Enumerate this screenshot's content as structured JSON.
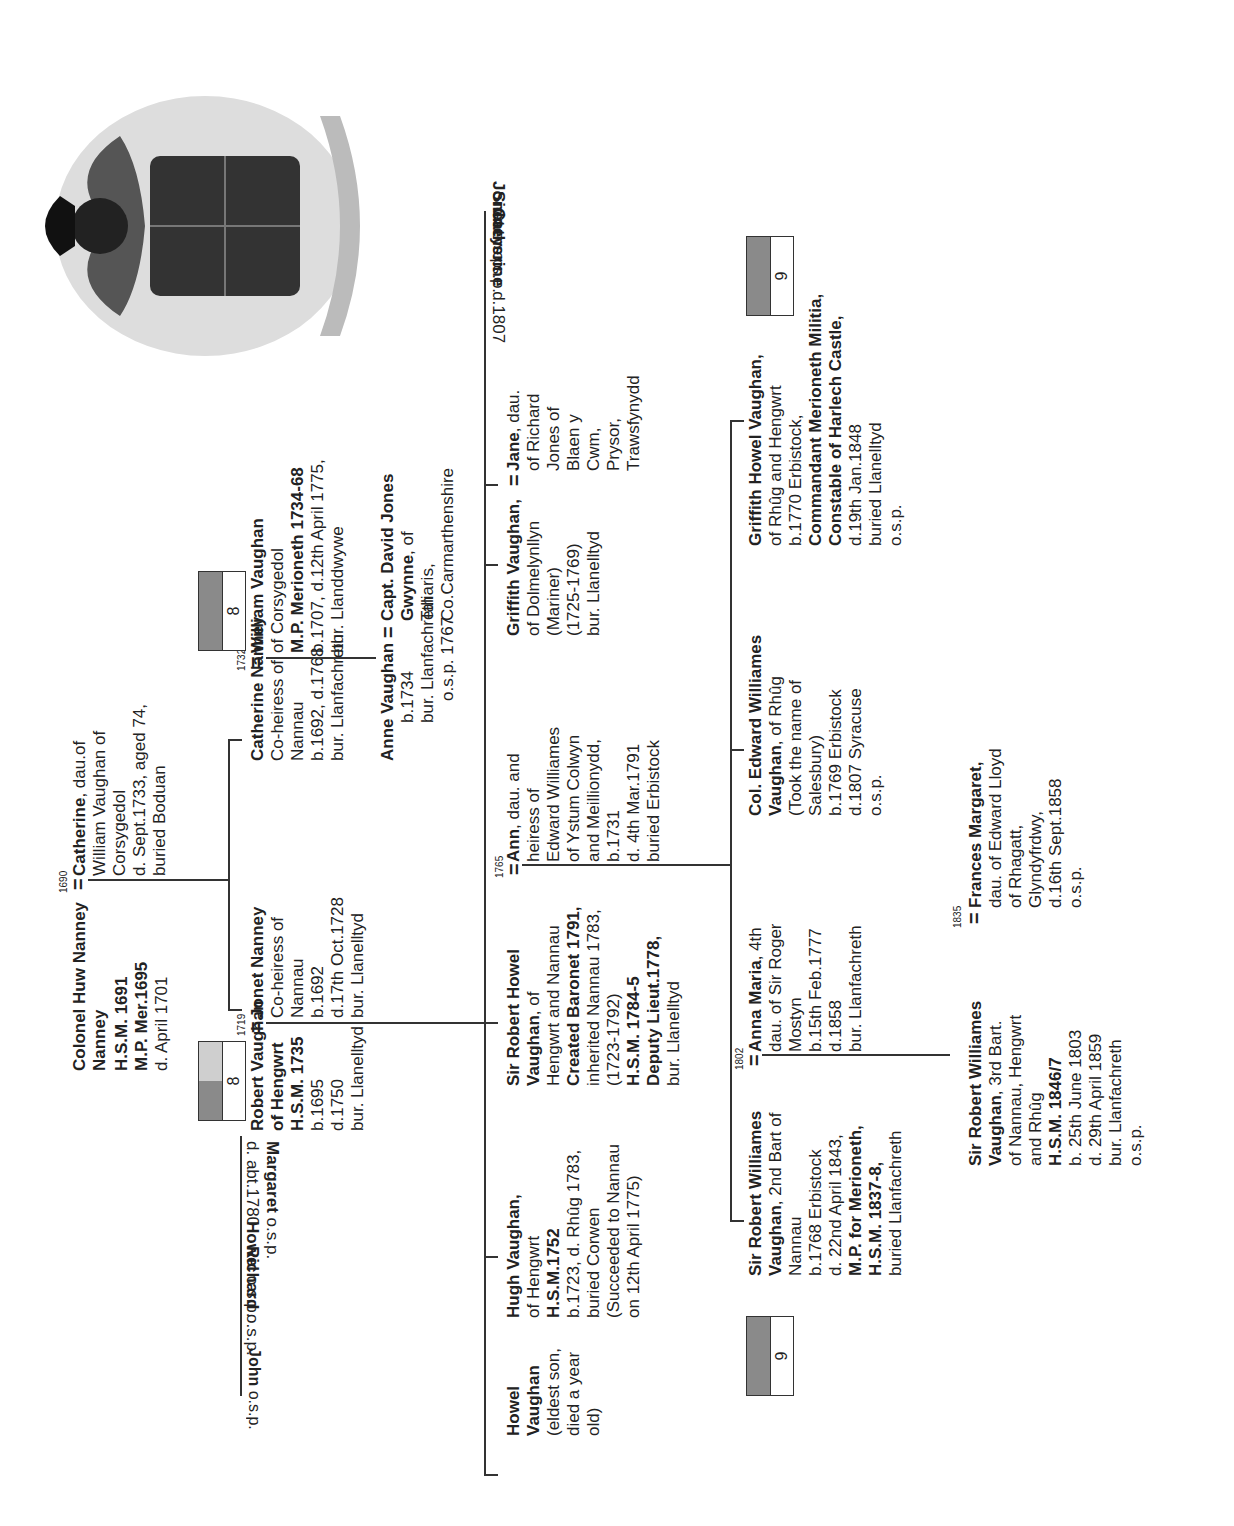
{
  "chart": {
    "colors": {
      "line": "#333333",
      "badge_dark": "#8a8a8a",
      "badge_light": "#cfcfcf"
    },
    "crest": {
      "icon": "coat-of-arms-icon",
      "description": "Heraldic crest with lion, helmet, quartered shield and mantling scroll"
    },
    "gen1": {
      "huw": {
        "name": "Colonel Huw Nanney",
        "lines": [
          "H.S.M. 1691",
          "M.P. Mer.1695"
        ],
        "plain": [
          "d. April 1701"
        ],
        "marriage_year": "1690"
      },
      "catherine": {
        "name": "Catherine",
        "suffix": ", dau.of",
        "lines": [
          "William Vaughan of",
          "Corsygedol",
          "d. Sept.1733, aged 74,",
          "buried Boduan"
        ]
      }
    },
    "gen2": {
      "robert": {
        "name": "Robert Vaughan",
        "bold_lines": [
          "of Hengwrt",
          "H.S.M. 1735"
        ],
        "lines": [
          "b.1695",
          "d.1750",
          "bur. Llanelltyd"
        ],
        "badge": "8",
        "marriage_year": "1719"
      },
      "siblings": [
        {
          "name": "Margaret",
          "note": "o.s.p.",
          "extra": "d. abt.1780"
        },
        {
          "name": "Howel",
          "note": "o.s.p."
        },
        {
          "name": "Richard",
          "note": "o.s.p."
        },
        {
          "name": "John",
          "note": "o.s.p."
        }
      ],
      "jonet": {
        "name": "Jonet Nanney",
        "lines": [
          "Co-heiress of",
          "Nannau",
          "b.1692",
          "d.17th Oct.1728",
          "bur. Llanelltyd"
        ]
      },
      "catherine_nanney": {
        "name": "Catherine Nanney",
        "lines": [
          "Co-heiress of",
          "Nannau",
          "b.1692, d.1768",
          "bur. Llanfachreth"
        ],
        "marriage_year": "1732"
      },
      "william": {
        "name": "William Vaughan",
        "lines": [
          "of Corsygedol"
        ],
        "bold_lines": [
          "M.P. Merioneth 1734-68"
        ],
        "lines2": [
          "b.1707, d.12th April 1775,",
          "bur. Llanddwywe"
        ],
        "badge": "8"
      }
    },
    "anne": {
      "name": "Anne Vaughan",
      "lines": [
        "b.1734",
        "bur. Llanfachreth",
        "o.s.p. 1767"
      ]
    },
    "david": {
      "name": "Capt. David Jones",
      "name2": "Gwynne",
      "suffix": ", of",
      "lines": [
        "Taliaris,",
        "Co.Carmarthenshire"
      ]
    },
    "gen3": {
      "howel": {
        "name": "Howel",
        "name2": "Vaughan",
        "lines": [
          "(eldest son,",
          "died a year",
          "old)"
        ]
      },
      "hugh": {
        "name": "Hugh Vaughan,",
        "lines": [
          "of Hengwrt"
        ],
        "bold_lines": [
          "H.S.M.1752"
        ],
        "lines2": [
          "b.1723, d. Rhûg 1783,",
          "buried Corwen",
          "(Succeeded to Nannau",
          "on 12th April 1775)"
        ]
      },
      "sir_robert_howel": {
        "name": "Sir Robert Howel",
        "name2": "Vaughan",
        "suffix": ", of",
        "lines": [
          "Hengwrt and Nannau"
        ],
        "bold1": "Created Baronet 1791,",
        "lines2": [
          "inherited Nannau 1783,",
          "(1723-1792)"
        ],
        "bold2": [
          "H.S.M. 1784-5",
          "Deputy Lieut.1778,"
        ],
        "lines3": [
          "bur. Llanelltyd"
        ],
        "marriage_year": "1765"
      },
      "ann": {
        "name": "Ann",
        "suffix": ", dau. and",
        "lines": [
          "heiress of",
          "Edward Williames",
          "of Ystum Colwyn",
          "and Meillionydd,",
          "b.1731",
          "d. 4th Mar.1791",
          "buried Erbistock"
        ]
      },
      "griffith": {
        "name": "Griffith Vaughan,",
        "lines": [
          "of Dolmelynllyn",
          "(Mariner)",
          "(1725-1769)",
          "bur. Llanelltyd"
        ]
      },
      "jane": {
        "name": "Jane",
        "suffix": ", dau.",
        "lines": [
          "of Richard",
          "Jones of",
          "Blaen y",
          "Cwm,",
          "Prysor,",
          "Trawsfynydd"
        ]
      },
      "siblings": [
        {
          "name": "Catherine",
          "note": "d.1807"
        },
        {
          "name": "Sidney",
          "note": "o.s.p."
        },
        {
          "name": "Jonet",
          "note": "o.s.p."
        }
      ]
    },
    "gen4": {
      "sir_robert_williames": {
        "name": "Sir Robert Williames",
        "name2": "Vaughan",
        "suffix": ", 2nd Bart of",
        "lines": [
          "Nannau",
          "b.1768 Erbistock",
          "d. 22nd April 1843,"
        ],
        "bold_lines": [
          "M.P. for Merioneth,",
          "H.S.M. 1837-8,"
        ],
        "lines2": [
          "buried Llanfachreth"
        ],
        "badge": "9",
        "marriage_year": "1802"
      },
      "anna_maria": {
        "name": "Anna Maria",
        "suffix": ", 4th",
        "lines": [
          "dau. of Sir Roger",
          "Mostyn",
          "b.15th Feb.1777",
          "d.1858",
          "bur. Llanfachreth"
        ]
      },
      "edward": {
        "name": "Col. Edward Williames",
        "name2": "Vaughan",
        "suffix": ", of Rhûg",
        "lines": [
          "(Took the name of",
          "Salesbury)",
          "b.1769 Erbistock",
          "d.1807 Syracuse",
          "o.s.p."
        ]
      },
      "griffith_howel": {
        "name": "Griffith Howel Vaughan,",
        "lines": [
          "of Rhûg and Hengwrt",
          "b.1770 Erbistock,"
        ],
        "bold_lines": [
          "Commandant Merioneth Militia,",
          "Constable of Harlech Castle,"
        ],
        "lines2": [
          "d.19th Jan.1848",
          "buried Llanelltyd",
          "o.s.p."
        ],
        "badge": "9"
      }
    },
    "gen5": {
      "sir_robert_3rd": {
        "name": "Sir Robert Williames",
        "name2": "Vaughan",
        "suffix": ", 3rd Bart.",
        "lines": [
          "of Nannau, Hengwrt",
          "and Rhûg"
        ],
        "bold_lines": [
          "H.S.M. 1846/7"
        ],
        "lines2": [
          "b. 25th June 1803",
          "d. 29th April 1859",
          "bur. Llanfachreth",
          "o.s.p."
        ],
        "marriage_year": "1835"
      },
      "frances": {
        "name": "Frances Margaret,",
        "lines": [
          "dau. of Edward Lloyd",
          "of Rhagatt,",
          "Glyndyfrdwy,",
          "d.16th Sept.1858",
          "o.s.p."
        ]
      }
    }
  }
}
